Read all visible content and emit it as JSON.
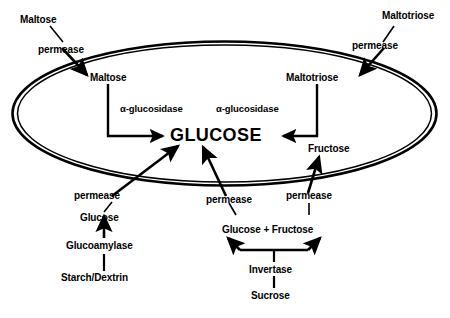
{
  "diagram": {
    "membrane": {
      "name": "cell-membrane-ellipse",
      "style": "double-line-ellipse",
      "color": "#000000"
    },
    "central_metabolite": "GLUCOSE",
    "external_labels": {
      "maltose": "Maltose",
      "maltotriose": "Maltotriose",
      "glucose_external": "Glucose",
      "glucose_fructose": "Glucose + Fructose",
      "starch_dextrin": "Starch/Dextrin",
      "sucrose": "Sucrose"
    },
    "internal_labels": {
      "maltose": "Maltose",
      "maltotriose": "Maltotriose",
      "fructose": "Fructose"
    },
    "enzymes": {
      "alpha_glucosidase_left": "α-glucosidase",
      "alpha_glucosidase_right": "α-glucosidase",
      "glucoamylase": "Glucoamylase",
      "invertase": "Invertase"
    },
    "transporters": {
      "maltose_permease": "permease",
      "maltotriose_permease": "permease",
      "glucose_permease": "permease",
      "glucose_fructose_permease": "permease",
      "fructose_permease": "permease"
    },
    "colors": {
      "background": "#ffffff",
      "stroke": "#000000",
      "text": "#000000"
    }
  }
}
